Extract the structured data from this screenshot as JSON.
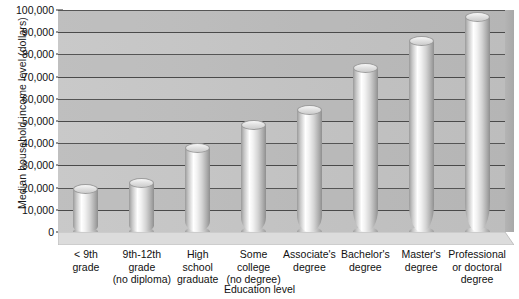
{
  "chart_data": {
    "type": "bar",
    "title": "",
    "xlabel": "Education level",
    "ylabel": "Median household income level (dollars)",
    "categories": [
      "< 9th\ngrade",
      "9th-12th\ngrade\n(no diploma)",
      "High\nschool\ngraduate",
      "Some\ncollege\n(no degree)",
      "Associate's\ndegree",
      "Bachelor's\ndegree",
      "Master's\ndegree",
      "Professional\nor doctoral\ndegree"
    ],
    "values": [
      19500,
      22000,
      38000,
      48000,
      55000,
      74000,
      86000,
      97000
    ],
    "ylim": [
      0,
      100000
    ],
    "ytick_labels": [
      "100,000",
      "90,000",
      "80,000",
      "70,000",
      "60,000",
      "50,000",
      "40,000",
      "30,000",
      "20,000",
      "10,000",
      "0"
    ],
    "ytick_values": [
      100000,
      90000,
      80000,
      70000,
      60000,
      50000,
      40000,
      30000,
      20000,
      10000,
      0
    ],
    "grid": true,
    "legend": "none",
    "style": "3d-cylinder",
    "colors": {
      "wall": "#c5c5c5",
      "gridline": "#4a4a4a",
      "bar_light": "#ffffff",
      "bar_dark": "#8f8f8f",
      "floor": "#d8d8d8",
      "text": "#111111"
    }
  }
}
